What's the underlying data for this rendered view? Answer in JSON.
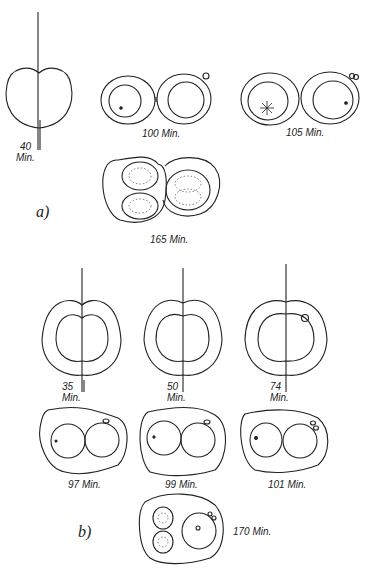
{
  "figure": {
    "panels": [
      {
        "label": "a)",
        "stages": [
          {
            "time": "40",
            "unit": "Min."
          },
          {
            "time": "100 Min."
          },
          {
            "time": "105 Min."
          },
          {
            "time": "165 Min."
          }
        ]
      },
      {
        "label": "b)",
        "stages": [
          {
            "time": "35",
            "unit": "Min."
          },
          {
            "time": "50",
            "unit": "Min."
          },
          {
            "time": "74",
            "unit": "Min."
          },
          {
            "time": "97 Min."
          },
          {
            "time": "99 Min."
          },
          {
            "time": "101 Min."
          },
          {
            "time": "170 Min."
          }
        ]
      }
    ],
    "colors": {
      "line": "#222222",
      "background": "#ffffff"
    }
  }
}
